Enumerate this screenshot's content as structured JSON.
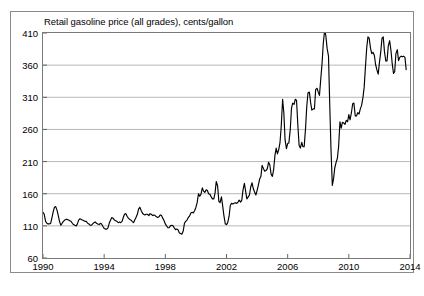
{
  "chart_data": {
    "type": "line",
    "title": "Retail gasoline price (all grades), cents/gallon",
    "xlabel": "",
    "ylabel": "",
    "xlim": [
      1990,
      2014
    ],
    "ylim": [
      60,
      410
    ],
    "ytick_labels": [
      "60",
      "110",
      "160",
      "210",
      "260",
      "310",
      "360",
      "410"
    ],
    "ytick_values": [
      60,
      110,
      160,
      210,
      260,
      310,
      360,
      410
    ],
    "xtick_labels": [
      "1990",
      "1994",
      "1998",
      "2002",
      "2006",
      "2010",
      "2014"
    ],
    "xtick_values": [
      1990,
      1994,
      1998,
      2002,
      2006,
      2010,
      2014
    ],
    "grid": "horizontal",
    "legend": "none",
    "line_color": "#000000",
    "grid_color": "#b0b0b0",
    "series": [
      {
        "name": "Retail gasoline price (all grades)",
        "x": [
          1990.0,
          1990.08,
          1990.17,
          1990.25,
          1990.33,
          1990.42,
          1990.5,
          1990.58,
          1990.67,
          1990.75,
          1990.83,
          1990.92,
          1991.0,
          1991.08,
          1991.17,
          1991.25,
          1991.33,
          1991.42,
          1991.5,
          1991.58,
          1991.67,
          1991.75,
          1991.83,
          1991.92,
          1992.0,
          1992.08,
          1992.17,
          1992.25,
          1992.33,
          1992.42,
          1992.5,
          1992.58,
          1992.67,
          1992.75,
          1992.83,
          1992.92,
          1993.0,
          1993.08,
          1993.17,
          1993.25,
          1993.33,
          1993.42,
          1993.5,
          1993.58,
          1993.67,
          1993.75,
          1993.83,
          1993.92,
          1994.0,
          1994.08,
          1994.17,
          1994.25,
          1994.33,
          1994.42,
          1994.5,
          1994.58,
          1994.67,
          1994.75,
          1994.83,
          1994.92,
          1995.0,
          1995.08,
          1995.17,
          1995.25,
          1995.33,
          1995.42,
          1995.5,
          1995.58,
          1995.67,
          1995.75,
          1995.83,
          1995.92,
          1996.0,
          1996.08,
          1996.17,
          1996.25,
          1996.33,
          1996.42,
          1996.5,
          1996.58,
          1996.67,
          1996.75,
          1996.83,
          1996.92,
          1997.0,
          1997.08,
          1997.17,
          1997.25,
          1997.33,
          1997.42,
          1997.5,
          1997.58,
          1997.67,
          1997.75,
          1997.83,
          1997.92,
          1998.0,
          1998.08,
          1998.17,
          1998.25,
          1998.33,
          1998.42,
          1998.5,
          1998.58,
          1998.67,
          1998.75,
          1998.83,
          1998.92,
          1999.0,
          1999.08,
          1999.17,
          1999.25,
          1999.33,
          1999.42,
          1999.5,
          1999.58,
          1999.67,
          1999.75,
          1999.83,
          1999.92,
          2000.0,
          2000.08,
          2000.17,
          2000.25,
          2000.33,
          2000.42,
          2000.5,
          2000.58,
          2000.67,
          2000.75,
          2000.83,
          2000.92,
          2001.0,
          2001.08,
          2001.17,
          2001.25,
          2001.33,
          2001.42,
          2001.5,
          2001.58,
          2001.67,
          2001.75,
          2001.83,
          2001.92,
          2002.0,
          2002.08,
          2002.17,
          2002.25,
          2002.33,
          2002.42,
          2002.5,
          2002.58,
          2002.67,
          2002.75,
          2002.83,
          2002.92,
          2003.0,
          2003.08,
          2003.17,
          2003.25,
          2003.33,
          2003.42,
          2003.5,
          2003.58,
          2003.67,
          2003.75,
          2003.83,
          2003.92,
          2004.0,
          2004.08,
          2004.17,
          2004.25,
          2004.33,
          2004.42,
          2004.5,
          2004.58,
          2004.67,
          2004.75,
          2004.83,
          2004.92,
          2005.0,
          2005.08,
          2005.17,
          2005.25,
          2005.33,
          2005.42,
          2005.5,
          2005.58,
          2005.67,
          2005.75,
          2005.83,
          2005.92,
          2006.0,
          2006.08,
          2006.17,
          2006.25,
          2006.33,
          2006.42,
          2006.5,
          2006.58,
          2006.67,
          2006.75,
          2006.83,
          2006.92,
          2007.0,
          2007.08,
          2007.17,
          2007.25,
          2007.33,
          2007.42,
          2007.5,
          2007.58,
          2007.67,
          2007.75,
          2007.83,
          2007.92,
          2008.0,
          2008.08,
          2008.17,
          2008.25,
          2008.33,
          2008.42,
          2008.5,
          2008.58,
          2008.67,
          2008.75,
          2008.83,
          2008.92,
          2009.0,
          2009.08,
          2009.17,
          2009.25,
          2009.33,
          2009.42,
          2009.5,
          2009.58,
          2009.67,
          2009.75,
          2009.83,
          2009.92,
          2010.0,
          2010.08,
          2010.17,
          2010.25,
          2010.33,
          2010.42,
          2010.5,
          2010.58,
          2010.67,
          2010.75,
          2010.83,
          2010.92,
          2011.0,
          2011.08,
          2011.17,
          2011.25,
          2011.33,
          2011.42,
          2011.5,
          2011.58,
          2011.67,
          2011.75,
          2011.83,
          2011.92,
          2012.0,
          2012.08,
          2012.17,
          2012.25,
          2012.33,
          2012.42,
          2012.5,
          2012.58,
          2012.67,
          2012.75,
          2012.83,
          2012.92,
          2013.0,
          2013.08,
          2013.17,
          2013.25,
          2013.33,
          2013.42,
          2013.5,
          2013.58,
          2013.67,
          2013.75
        ],
        "values": [
          131,
          128,
          117,
          114,
          113,
          113,
          114,
          122,
          132,
          139,
          140,
          134,
          126,
          117,
          111,
          114,
          117,
          119,
          120,
          120,
          119,
          118,
          117,
          114,
          112,
          111,
          110,
          113,
          119,
          121,
          120,
          119,
          118,
          117,
          117,
          114,
          113,
          111,
          111,
          113,
          115,
          116,
          114,
          113,
          112,
          114,
          113,
          109,
          106,
          105,
          105,
          107,
          114,
          119,
          123,
          122,
          119,
          118,
          117,
          115,
          116,
          115,
          117,
          123,
          128,
          129,
          125,
          122,
          120,
          119,
          117,
          115,
          119,
          123,
          128,
          136,
          139,
          134,
          130,
          128,
          127,
          128,
          128,
          126,
          129,
          128,
          126,
          127,
          126,
          124,
          123,
          124,
          127,
          126,
          122,
          118,
          113,
          110,
          107,
          107,
          110,
          111,
          110,
          107,
          104,
          105,
          104,
          99,
          98,
          97,
          102,
          114,
          117,
          119,
          123,
          125,
          130,
          131,
          130,
          134,
          139,
          146,
          160,
          156,
          159,
          169,
          164,
          162,
          166,
          165,
          160,
          159,
          155,
          152,
          152,
          161,
          179,
          172,
          148,
          146,
          155,
          141,
          126,
          113,
          112,
          115,
          125,
          142,
          145,
          144,
          145,
          146,
          145,
          147,
          150,
          147,
          150,
          166,
          176,
          164,
          152,
          155,
          158,
          170,
          177,
          168,
          163,
          158,
          165,
          173,
          183,
          187,
          204,
          199,
          195,
          196,
          199,
          209,
          205,
          190,
          187,
          197,
          220,
          231,
          222,
          229,
          240,
          265,
          307,
          286,
          244,
          230,
          238,
          239,
          260,
          293,
          301,
          299,
          307,
          305,
          265,
          235,
          231,
          240,
          233,
          233,
          262,
          296,
          317,
          318,
          302,
          290,
          292,
          292,
          322,
          324,
          318,
          313,
          340,
          363,
          394,
          415,
          405,
          386,
          374,
          300,
          232,
          173,
          183,
          200,
          209,
          215,
          233,
          272,
          262,
          271,
          270,
          268,
          274,
          272,
          283,
          275,
          286,
          300,
          301,
          281,
          281,
          286,
          284,
          292,
          297,
          309,
          325,
          355,
          387,
          404,
          402,
          386,
          378,
          380,
          375,
          361,
          353,
          346,
          364,
          379,
          402,
          404,
          381,
          366,
          367,
          390,
          398,
          384,
          364,
          347,
          350,
          378,
          384,
          367,
          372,
          374,
          373,
          374,
          372,
          353
        ]
      }
    ]
  },
  "axes": {
    "y_ticks": [
      "410",
      "360",
      "310",
      "260",
      "210",
      "160",
      "110",
      "60"
    ],
    "x_ticks": [
      "1990",
      "1994",
      "1998",
      "2002",
      "2006",
      "2010",
      "2014"
    ]
  }
}
